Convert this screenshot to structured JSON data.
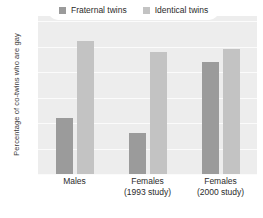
{
  "chart_data": {
    "type": "bar",
    "title": "",
    "xlabel": "",
    "ylabel": "Percentage of co-twins who are gay",
    "categories": [
      "Males",
      "Females\n(1993 study)",
      "Females\n(2000 study)"
    ],
    "series": [
      {
        "name": "Fraternal twins",
        "color": "#9b9b9b",
        "values": [
          22,
          16,
          44
        ]
      },
      {
        "name": "Identical twins",
        "color": "#c3c3c3",
        "values": [
          52,
          48,
          49
        ]
      }
    ],
    "ylim": [
      0,
      62
    ],
    "yticks": [
      0,
      10,
      20,
      30,
      40,
      50,
      60
    ],
    "ytick_labels": [
      "0",
      "10",
      "20",
      "30",
      "40",
      "50",
      "60"
    ],
    "grid": true,
    "legend_position": "top-center",
    "plot_background": "#ededed",
    "gridline_color": "#fbfbfb"
  },
  "legend": {
    "items": [
      {
        "label": "Fraternal twins",
        "swatch": "fraternal"
      },
      {
        "label": "Identical twins",
        "swatch": "identical"
      }
    ]
  },
  "axes": {
    "y_title": "Percentage of co-twins who are gay",
    "y_ticks": [
      "60",
      "50",
      "40",
      "30",
      "20",
      "10",
      "0"
    ],
    "x_groups": [
      {
        "line1": "Males",
        "line2": ""
      },
      {
        "line1": "Females",
        "line2": "(1993 study)"
      },
      {
        "line1": "Females",
        "line2": "(2000 study)"
      }
    ]
  }
}
